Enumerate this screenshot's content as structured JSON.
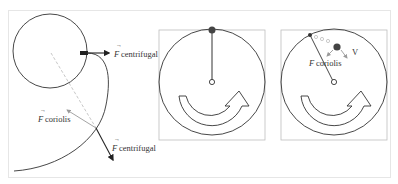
{
  "figure": {
    "panels": [
      {
        "id": "trajectory",
        "labels": {
          "f_symbol": "F",
          "centrifugal_top": "centrifugal",
          "coriolis": "coriolis",
          "centrifugal_bottom": "centrifugal"
        }
      },
      {
        "id": "rotating-disc-start",
        "labels": {}
      },
      {
        "id": "rotating-disc-moving",
        "labels": {
          "f_symbol": "F",
          "coriolis": "coriolis",
          "velocity": "V"
        }
      }
    ],
    "colors": {
      "stroke": "#333333",
      "gray_arrow": "#9a9a9a",
      "dashed": "#c8c8c8",
      "frame": "#e6e6e6",
      "box": "#bdbdbd"
    }
  }
}
